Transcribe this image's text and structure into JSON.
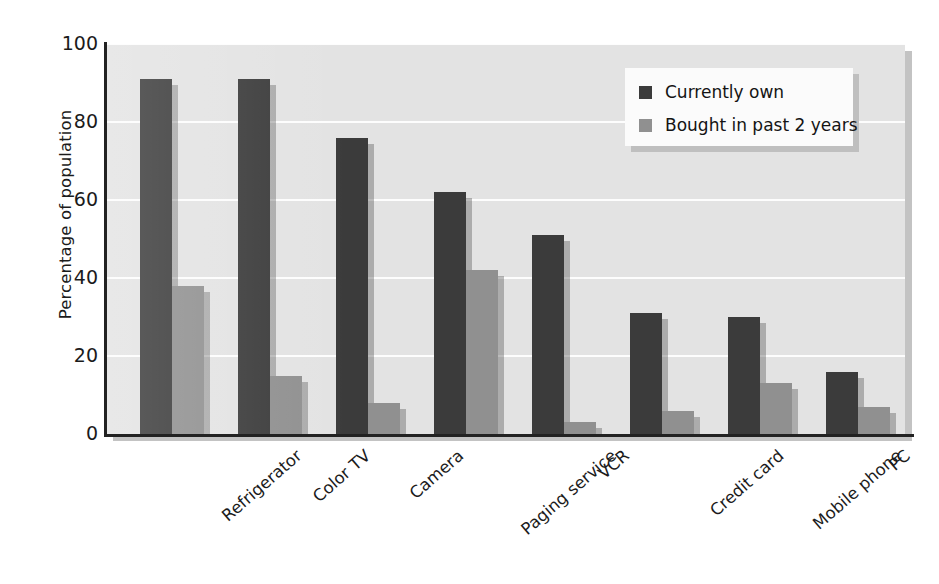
{
  "chart_data": {
    "type": "bar",
    "title": "",
    "xlabel": "",
    "ylabel": "Percentage of population",
    "ylim": [
      0,
      100
    ],
    "yticks": [
      0,
      20,
      40,
      60,
      80,
      100
    ],
    "grid": "horizontal",
    "legend_position": "top-right",
    "orientation": "vertical",
    "grouping": "grouped",
    "categories": [
      "Refrigerator",
      "Color TV",
      "Camera",
      "Paging service",
      "VCR",
      "Credit card",
      "Mobile phone",
      "PC"
    ],
    "series": [
      {
        "name": "Currently own",
        "color": "#3b3b3b",
        "values": [
          91,
          91,
          76,
          62,
          51,
          31,
          30,
          16
        ]
      },
      {
        "name": "Bought in past 2 years",
        "color": "#909090",
        "values": [
          38,
          15,
          8,
          42,
          3,
          6,
          13,
          7
        ]
      }
    ]
  },
  "legend": {
    "items": [
      {
        "label": "Currently own",
        "swatch": "own"
      },
      {
        "label": "Bought in past 2 years",
        "swatch": "bought"
      }
    ]
  },
  "colors": {
    "series_own": "#3b3b3b",
    "series_bought": "#909090",
    "plot_background": "#e3e3e3",
    "gridline": "#fdfdfd",
    "axis": "#222222",
    "legend_background": "#fbfbfb",
    "text": "#1b1b1b"
  }
}
